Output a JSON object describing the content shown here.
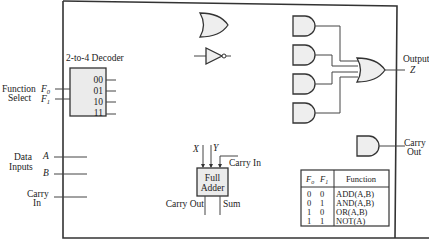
{
  "diagram": {
    "decoder": {
      "label": "2-to-4 Decoder",
      "outputs": [
        "00",
        "01",
        "10",
        "11"
      ]
    },
    "inputs": {
      "function_select_label_1": "Function",
      "function_select_label_2": "Select",
      "f0": "F",
      "f0_sub": "0",
      "f1": "F",
      "f1_sub": "1",
      "data_label_1": "Data",
      "data_label_2": "Inputs",
      "a": "A",
      "b": "B",
      "carry_in_1": "Carry",
      "carry_in_2": "In"
    },
    "full_adder": {
      "label_1": "Full",
      "label_2": "Adder",
      "x": "X",
      "y": "Y",
      "carry_in": "Carry In",
      "carry_out": "Carry Out",
      "sum": "Sum"
    },
    "outputs": {
      "output_label": "Output",
      "z": "Z",
      "carry_out_1": "Carry",
      "carry_out_2": "Out"
    },
    "function_table": {
      "headers": [
        "F",
        "F",
        "Function"
      ],
      "header_subs": [
        "o",
        "1"
      ],
      "rows": [
        {
          "f0": "0",
          "f1": "0",
          "function": "ADD(A,B)"
        },
        {
          "f0": "0",
          "f1": "1",
          "function": "AND(A,B)"
        },
        {
          "f0": "1",
          "f1": "0",
          "function": "OR(A,B)"
        },
        {
          "f0": "1",
          "f1": "1",
          "function": "NOT(A)"
        }
      ]
    }
  }
}
